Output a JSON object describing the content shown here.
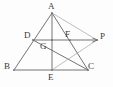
{
  "figure": {
    "kind": "euclidean-geometry-diagram",
    "width": 113,
    "height": 87,
    "background_color": "#fdfdfd",
    "stroke_color_main": "#6b6b6b",
    "stroke_color_light": "#a8a8a8",
    "label_color": "#3a3a3a",
    "points": [
      {
        "id": "A",
        "label": "A",
        "x": 52,
        "y": 13,
        "label_x": 48,
        "label_y": 2
      },
      {
        "id": "D",
        "label": "D",
        "x": 33,
        "y": 40,
        "label_x": 24,
        "label_y": 31
      },
      {
        "id": "G",
        "label": "G",
        "x": 52,
        "y": 40,
        "label_x": 40,
        "label_y": 42
      },
      {
        "id": "F",
        "label": "F",
        "x": 70,
        "y": 40,
        "label_x": 65,
        "label_y": 30
      },
      {
        "id": "P",
        "label": "P",
        "x": 97,
        "y": 40,
        "label_x": 100,
        "label_y": 32
      },
      {
        "id": "B",
        "label": "B",
        "x": 14,
        "y": 70,
        "label_x": 4,
        "label_y": 62
      },
      {
        "id": "E",
        "label": "E",
        "x": 52,
        "y": 70,
        "label_x": 48,
        "label_y": 73
      },
      {
        "id": "C",
        "label": "C",
        "x": 88,
        "y": 70,
        "label_x": 88,
        "label_y": 62
      }
    ],
    "segments": [
      {
        "id": "AB",
        "from": "A",
        "to": "B",
        "shade": "main"
      },
      {
        "id": "AC",
        "from": "A",
        "to": "C",
        "shade": "main"
      },
      {
        "id": "BC",
        "from": "B",
        "to": "C",
        "shade": "main"
      },
      {
        "id": "AE",
        "from": "A",
        "to": "E",
        "shade": "main"
      },
      {
        "id": "DC",
        "from": "D",
        "to": "C",
        "shade": "main"
      },
      {
        "id": "AP",
        "from": "A",
        "to": "P",
        "shade": "light"
      },
      {
        "id": "EP",
        "from": "E",
        "to": "P",
        "shade": "light"
      }
    ],
    "rays": [
      {
        "id": "DP",
        "from": "D",
        "to": "P",
        "shade": "main",
        "arrowhead": true
      }
    ]
  }
}
